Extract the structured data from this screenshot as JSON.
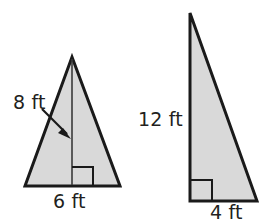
{
  "figure": {
    "background_color": "#ffffff",
    "fill_color": "#d9d9d9",
    "outline_color": "#1a1a1a",
    "text_color": "#231f20",
    "shapes": [
      {
        "name": "isosceles-triangle",
        "labels": [
          "8 ft",
          "6 ft"
        ],
        "height_label": "8 ft",
        "base_label": "6 ft",
        "has_right_angle_mark": true,
        "has_height_segment": true,
        "has_leader_arrow": true
      },
      {
        "name": "right-triangle",
        "labels": [
          "12 ft",
          "4 ft"
        ],
        "height_label": "12 ft",
        "base_label": "4 ft",
        "has_right_angle_mark": true,
        "has_height_segment": false,
        "has_leader_arrow": false
      }
    ]
  },
  "labels": {
    "left_height": "8 ft",
    "left_base": "6 ft",
    "right_height": "12 ft",
    "right_base": "4 ft"
  }
}
